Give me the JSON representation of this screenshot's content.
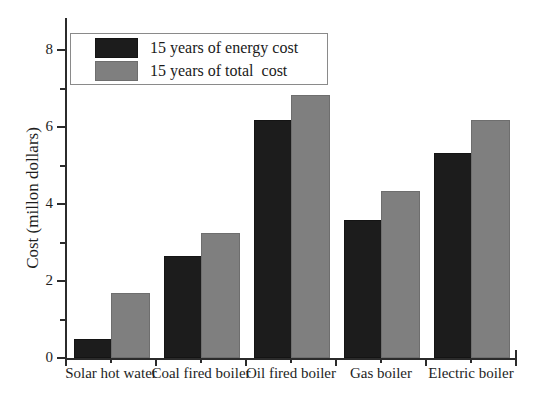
{
  "chart_data": {
    "type": "bar",
    "title": "",
    "xlabel": "",
    "ylabel": "Cost (millon dollars)",
    "ylim": [
      0,
      8.6
    ],
    "yticks": [
      0,
      2,
      4,
      6,
      8
    ],
    "ytick_labels": [
      "0",
      "2",
      "4",
      "6",
      "8"
    ],
    "minor_ticks": [
      1,
      3,
      5,
      7
    ],
    "grid": false,
    "legend_position": "upper left",
    "categories": [
      "Solar hot water",
      "Coal fired boiler",
      "Oil fired boiler",
      "Gas boiler",
      "Electric boiler"
    ],
    "series": [
      {
        "name": "15 years of energy cost",
        "color": "#1c1c1c",
        "values": [
          0.45,
          2.6,
          6.13,
          3.53,
          5.28
        ]
      },
      {
        "name": "15 years of total  cost",
        "color": "#7f7f7f",
        "values": [
          1.63,
          3.2,
          6.78,
          4.28,
          6.13
        ]
      }
    ]
  },
  "legend": {
    "items": [
      {
        "label": "15 years of energy cost",
        "swatch": "#1c1c1c"
      },
      {
        "label": "15 years of total  cost",
        "swatch": "#7f7f7f"
      }
    ]
  }
}
